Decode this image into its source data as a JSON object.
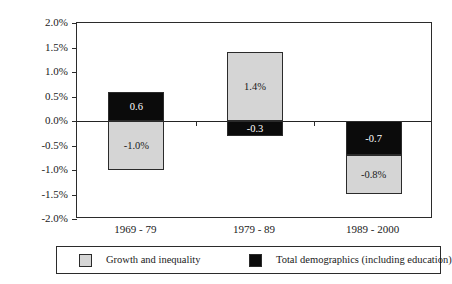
{
  "chart_data": {
    "type": "bar",
    "subtype": "stacked-bar-diverging",
    "title": "",
    "xlabel": "",
    "ylabel": "Percentage-point changes",
    "ylim": [
      -2.0,
      2.0
    ],
    "ytick_step": 0.5,
    "grid": false,
    "legend_position": "bottom",
    "categories": [
      "1969 - 79",
      "1979 - 89",
      "1989 - 2000"
    ],
    "ytick_labels": [
      "2.0%",
      "1.5%",
      "1.0%",
      "0.5%",
      "0.0%",
      "-0.5%",
      "-1.0%",
      "-1.5%",
      "-2.0%"
    ],
    "ytick_values": [
      2.0,
      1.5,
      1.0,
      0.5,
      0.0,
      -0.5,
      -1.0,
      -1.5,
      -2.0
    ],
    "series": [
      {
        "name": "Growth and inequality",
        "color": "#d5d5d5",
        "values": [
          -1.0,
          1.4,
          -0.8
        ]
      },
      {
        "name": "Total demographics (including education)",
        "color": "#0b0b0b",
        "values": [
          0.6,
          -0.3,
          -0.7
        ]
      }
    ],
    "segments": [
      {
        "category": "1969 - 79",
        "series": "Total demographics (including education)",
        "label": "0.6",
        "value": 0.6,
        "from": 0.0,
        "to": 0.6,
        "fill": "#0b0b0b",
        "text_color": "#ffffff"
      },
      {
        "category": "1969 - 79",
        "series": "Growth and inequality",
        "label": "-1.0%",
        "value": -1.0,
        "from": 0.0,
        "to": -1.0,
        "fill": "#d5d5d5",
        "text_color": "#1a1a1a"
      },
      {
        "category": "1979 - 89",
        "series": "Growth and inequality",
        "label": "1.4%",
        "value": 1.4,
        "from": 0.0,
        "to": 1.4,
        "fill": "#d5d5d5",
        "text_color": "#1a1a1a"
      },
      {
        "category": "1979 - 89",
        "series": "Total demographics (including education)",
        "label": "-0.3",
        "value": -0.3,
        "from": 0.0,
        "to": -0.3,
        "fill": "#0b0b0b",
        "text_color": "#ffffff"
      },
      {
        "category": "1989 - 2000",
        "series": "Total demographics (including education)",
        "label": "-0.7",
        "value": -0.7,
        "from": 0.0,
        "to": -0.7,
        "fill": "#0b0b0b",
        "text_color": "#ffffff"
      },
      {
        "category": "1989 - 2000",
        "series": "Growth and inequality",
        "label": "-0.8%",
        "value": -0.8,
        "from": -0.7,
        "to": -1.5,
        "fill": "#d5d5d5",
        "text_color": "#1a1a1a"
      }
    ]
  },
  "legend": {
    "entries": [
      {
        "label": "Growth and inequality",
        "color": "#d5d5d5"
      },
      {
        "label": "Total demographics (including education)",
        "color": "#0b0b0b"
      }
    ]
  },
  "colors": {
    "growth_and_inequality": "#d5d5d5",
    "total_demographics": "#0b0b0b",
    "axis": "#2b2b2b",
    "background": "#ffffff"
  }
}
